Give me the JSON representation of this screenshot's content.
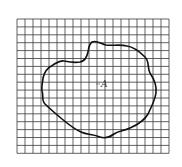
{
  "figure": {
    "type": "grid-area-estimation",
    "grid": {
      "x0": 17,
      "y0": 19,
      "cols": 19,
      "rows": 17,
      "cell_w": 8.0,
      "cell_h": 7.9,
      "line_color": "#3a3a3a"
    },
    "region": {
      "label": "A",
      "stroke_color": "#111111"
    }
  }
}
